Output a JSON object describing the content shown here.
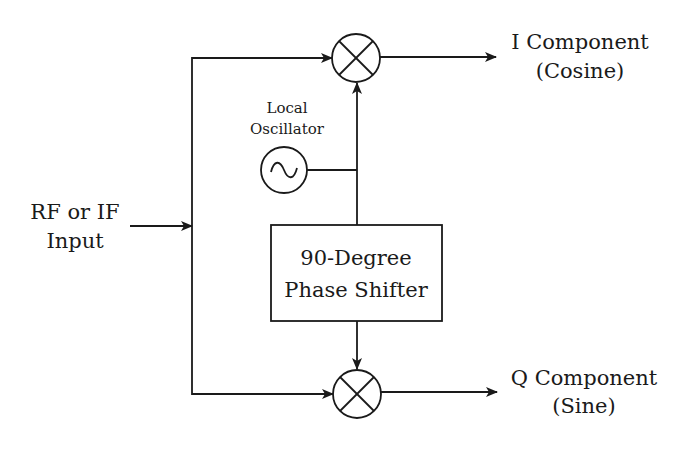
{
  "diagram": {
    "type": "block-diagram",
    "input": {
      "line1": "RF or IF",
      "line2": "Input"
    },
    "local_oscillator": {
      "line1": "Local",
      "line2": "Oscillator",
      "symbol": "sine-wave"
    },
    "phase_shifter": {
      "line1": "90-Degree",
      "line2": "Phase Shifter"
    },
    "mixers": [
      {
        "id": "top-mixer",
        "symbol": "multiply-x-circle"
      },
      {
        "id": "bottom-mixer",
        "symbol": "multiply-x-circle"
      }
    ],
    "outputs": {
      "i": {
        "line1": "I Component",
        "line2": "(Cosine)"
      },
      "q": {
        "line1": "Q Component",
        "line2": "(Sine)"
      }
    },
    "colors": {
      "line": "#1a1a1a",
      "background": "#ffffff"
    }
  }
}
